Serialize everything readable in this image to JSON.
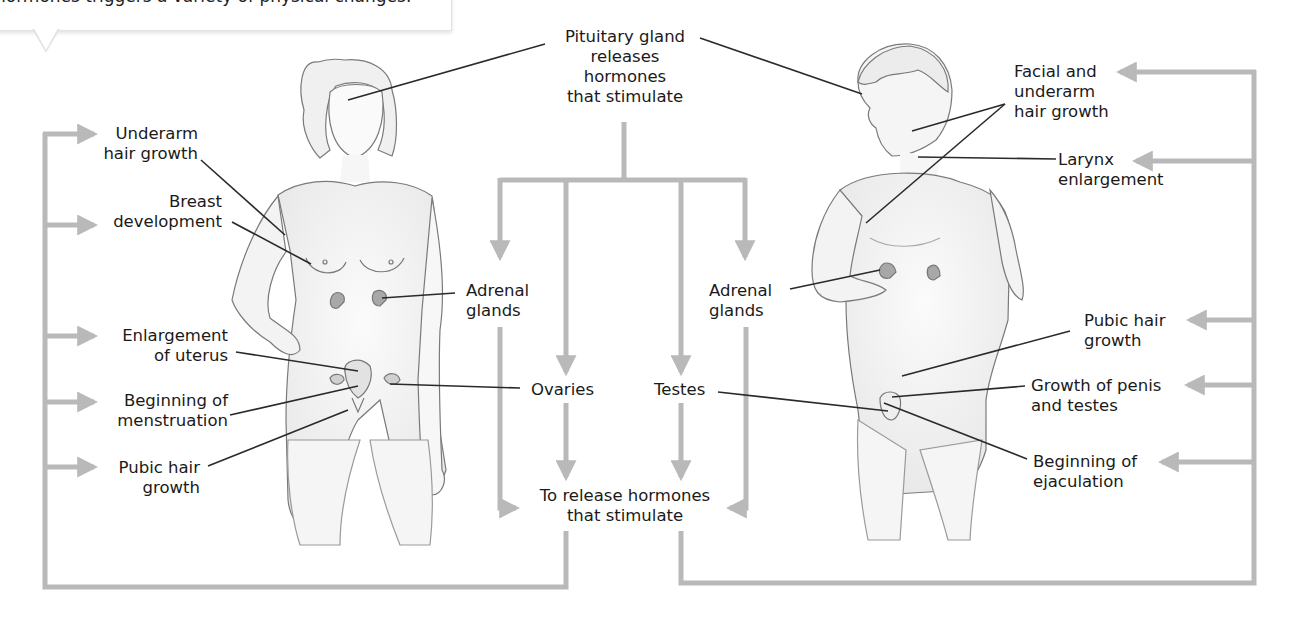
{
  "callout": {
    "text": "hormones triggers a variety of physical changes."
  },
  "center": {
    "pituitary": [
      "Pituitary gland",
      "releases",
      "hormones",
      "that stimulate"
    ],
    "release": [
      "To release hormones",
      "that stimulate"
    ],
    "adrenal_left": [
      "Adrenal",
      "glands"
    ],
    "adrenal_right": [
      "Adrenal",
      "glands"
    ],
    "ovaries": "Ovaries",
    "testes": "Testes"
  },
  "female": {
    "figure": "female-body-illustration",
    "labels": [
      {
        "lines": [
          "Underarm",
          "hair growth"
        ]
      },
      {
        "lines": [
          "Breast",
          "development"
        ]
      },
      {
        "lines": [
          "Enlargement",
          "of uterus"
        ]
      },
      {
        "lines": [
          "Beginning of",
          "menstruation"
        ]
      },
      {
        "lines": [
          "Pubic hair",
          "growth"
        ]
      }
    ]
  },
  "male": {
    "figure": "male-body-illustration",
    "labels": [
      {
        "lines": [
          "Facial and",
          "underarm",
          "hair growth"
        ]
      },
      {
        "lines": [
          "Larynx",
          "enlargement"
        ]
      },
      {
        "lines": [
          "Pubic hair",
          "growth"
        ]
      },
      {
        "lines": [
          "Growth of penis",
          "and testes"
        ]
      },
      {
        "lines": [
          "Beginning of",
          "ejaculation"
        ]
      }
    ]
  },
  "colors": {
    "connector": "#b9b9b9",
    "leader": "#2a2a2a",
    "skin_stroke": "#7a7a7a",
    "skin_fill": "#f3f3f3",
    "gland": "#9a9a9a"
  }
}
